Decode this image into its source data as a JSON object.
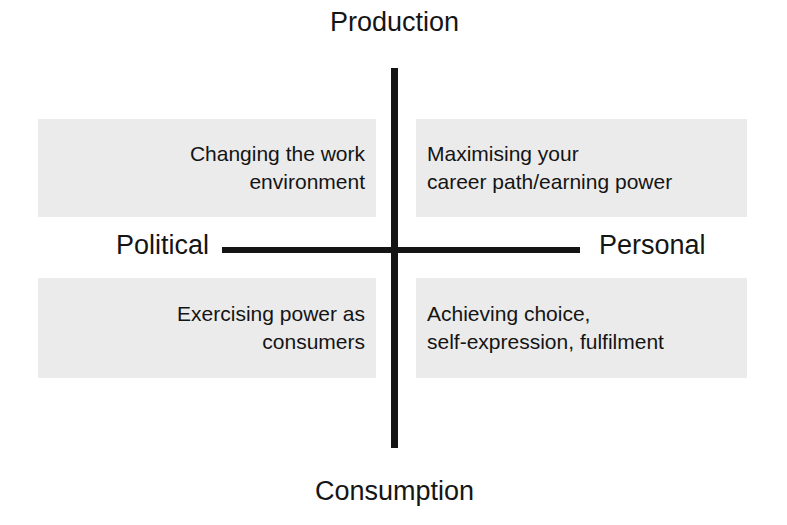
{
  "diagram": {
    "type": "two-by-two-quadrant-matrix",
    "background_color": "#ffffff",
    "axis_color": "#141414",
    "box_fill_color": "#ebebeb",
    "text_color": "#141414",
    "axes": {
      "vertical": {
        "top_pole_label": "Production",
        "bottom_pole_label": "Consumption"
      },
      "horizontal": {
        "left_pole_label": "Political",
        "right_pole_label": "Personal"
      }
    },
    "quadrants": [
      {
        "position": "top-left",
        "poles": "Production / Political",
        "text": "Changing the work\nenvironment",
        "align": "right"
      },
      {
        "position": "top-right",
        "poles": "Production / Personal",
        "text": "Maximising your\ncareer path/earning power",
        "align": "left"
      },
      {
        "position": "bottom-left",
        "poles": "Consumption / Political",
        "text": "Exercising power as\nconsumers",
        "align": "right"
      },
      {
        "position": "bottom-right",
        "poles": "Consumption / Personal",
        "text": "Achieving choice,\nself-expression, fulfilment",
        "align": "left"
      }
    ]
  }
}
